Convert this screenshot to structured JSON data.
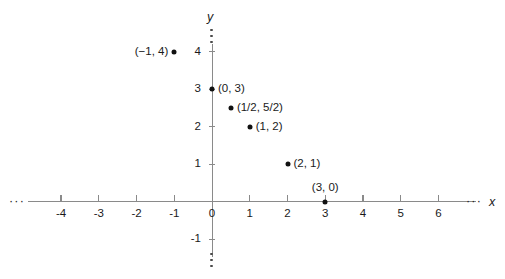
{
  "chart_data": {
    "type": "scatter",
    "title": "",
    "xlabel": "x",
    "ylabel": "y",
    "xlim": [
      -4,
      6
    ],
    "ylim": [
      -1,
      4
    ],
    "grid": false,
    "legend": null,
    "x_ticks": [
      "-4",
      "-3",
      "-2",
      "-1",
      "0",
      "1",
      "2",
      "3",
      "4",
      "5",
      "6"
    ],
    "x_tick_values": [
      -4,
      -3,
      -2,
      -1,
      0,
      1,
      2,
      3,
      4,
      5,
      6
    ],
    "y_ticks": [
      "4",
      "3",
      "2",
      "1",
      "-1"
    ],
    "y_tick_values": [
      4,
      3,
      2,
      1,
      -1
    ],
    "axis_continues_marker": "···",
    "points": [
      {
        "label": "(−1, 4)",
        "x": -1,
        "y": 4,
        "label_pos": "left"
      },
      {
        "label": "(0, 3)",
        "x": 0,
        "y": 3,
        "label_pos": "right"
      },
      {
        "label": "(1/2, 5/2)",
        "x": 0.5,
        "y": 2.5,
        "label_pos": "right"
      },
      {
        "label": "(1, 2)",
        "x": 1,
        "y": 2,
        "label_pos": "right"
      },
      {
        "label": "(2, 1)",
        "x": 2,
        "y": 1,
        "label_pos": "right"
      },
      {
        "label": "(3, 0)",
        "x": 3,
        "y": 0,
        "label_pos": "above"
      }
    ],
    "colors": {
      "axis": "#8a8a8a",
      "point": "#111111",
      "text": "#1a1a1a",
      "background": "#ffffff"
    }
  }
}
